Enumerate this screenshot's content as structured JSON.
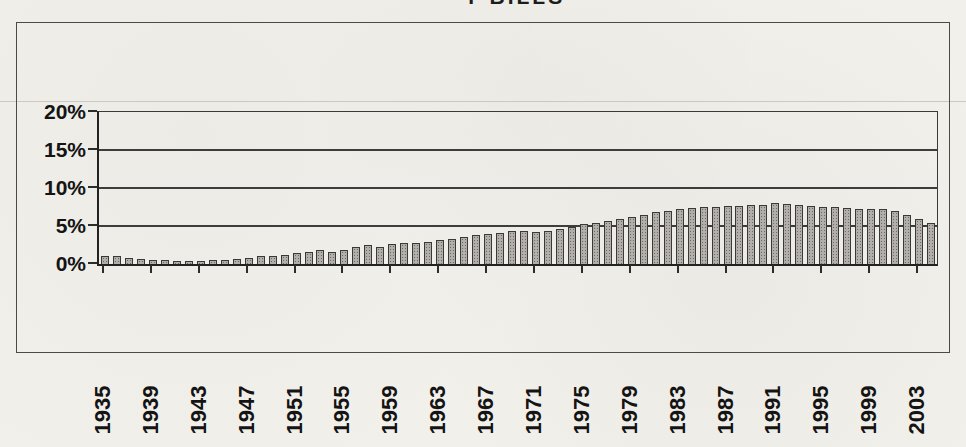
{
  "page": {
    "background": "#f2f0eb",
    "title_fragment": "T-BILLS"
  },
  "chart_data": {
    "type": "bar",
    "xlabel": "",
    "ylabel": "",
    "start_year": 1935,
    "end_year": 2004,
    "years": [
      1935,
      1936,
      1937,
      1938,
      1939,
      1940,
      1941,
      1942,
      1943,
      1944,
      1945,
      1946,
      1947,
      1948,
      1949,
      1950,
      1951,
      1952,
      1953,
      1954,
      1955,
      1956,
      1957,
      1958,
      1959,
      1960,
      1961,
      1962,
      1963,
      1964,
      1965,
      1966,
      1967,
      1968,
      1969,
      1970,
      1971,
      1972,
      1973,
      1974,
      1975,
      1976,
      1977,
      1978,
      1979,
      1980,
      1981,
      1982,
      1983,
      1984,
      1985,
      1986,
      1987,
      1988,
      1989,
      1990,
      1991,
      1992,
      1993,
      1994,
      1995,
      1996,
      1997,
      1998,
      1999,
      2000,
      2001,
      2002,
      2003,
      2004
    ],
    "values": [
      1.0,
      1.0,
      0.8,
      0.7,
      0.5,
      0.5,
      0.4,
      0.4,
      0.4,
      0.5,
      0.5,
      0.6,
      0.8,
      1.0,
      1.0,
      1.2,
      1.4,
      1.6,
      1.8,
      1.6,
      1.9,
      2.2,
      2.5,
      2.2,
      2.6,
      2.8,
      2.7,
      2.9,
      3.1,
      3.3,
      3.5,
      3.8,
      3.9,
      4.1,
      4.3,
      4.3,
      4.2,
      4.3,
      4.6,
      4.9,
      5.2,
      5.4,
      5.6,
      5.9,
      6.2,
      6.5,
      6.8,
      7.0,
      7.2,
      7.4,
      7.5,
      7.5,
      7.6,
      7.6,
      7.7,
      7.8,
      8.0,
      7.9,
      7.8,
      7.6,
      7.5,
      7.5,
      7.4,
      7.3,
      7.3,
      7.2,
      7.0,
      6.4,
      5.9,
      5.4
    ],
    "ylim": [
      0,
      20
    ],
    "y_tick_labels": [
      "20%",
      "15%",
      "10%",
      "5%",
      "0%"
    ],
    "y_tick_values": [
      20,
      15,
      10,
      5,
      0
    ],
    "x_tick_labels": [
      "1935",
      "1939",
      "1943",
      "1947",
      "1951",
      "1955",
      "1959",
      "1963",
      "1967",
      "1971",
      "1975",
      "1979",
      "1983",
      "1987",
      "1991",
      "1995",
      "1999",
      "2003"
    ],
    "x_label_interval_years": 4,
    "grid": true,
    "legend": false,
    "bar_fill": "#b2afaa",
    "bar_dot": "#6d6a64",
    "bar_border": "#3b3936",
    "axis_color": "#222220",
    "gridline_color": "#3d3d3b",
    "frame_color": "#4a4a48",
    "paper_color": "#f2f0eb"
  }
}
